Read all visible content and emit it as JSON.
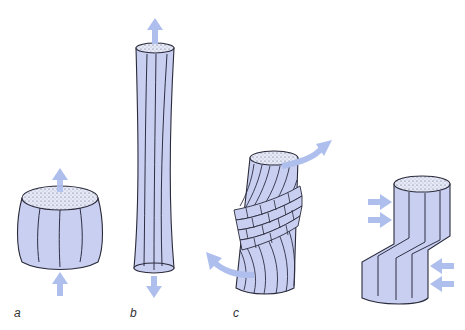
{
  "figure": {
    "colors": {
      "fill": "#c8cff0",
      "outline": "#2a2a3a",
      "fiber": "#2f2f45",
      "arrow": "#aebfee",
      "top_face": "#e4e8f8"
    },
    "panels": [
      {
        "id": "a",
        "label": "a",
        "shape": "compressed-barrel",
        "arrows": [
          "arrow-up-top",
          "arrow-up-bottom"
        ]
      },
      {
        "id": "b",
        "label": "b",
        "shape": "elongated-tension",
        "arrows": [
          "arrow-up-top",
          "arrow-down-bottom"
        ]
      },
      {
        "id": "c",
        "label": "c",
        "shape": "twisted-torsion",
        "arrows": [
          "curved-arrow-top-right",
          "curved-arrow-bottom-left"
        ]
      },
      {
        "id": "d",
        "label": "",
        "shape": "sheared-offset",
        "arrows": [
          "arrow-right-1",
          "arrow-right-2",
          "arrow-left-1",
          "arrow-left-2"
        ]
      }
    ]
  }
}
